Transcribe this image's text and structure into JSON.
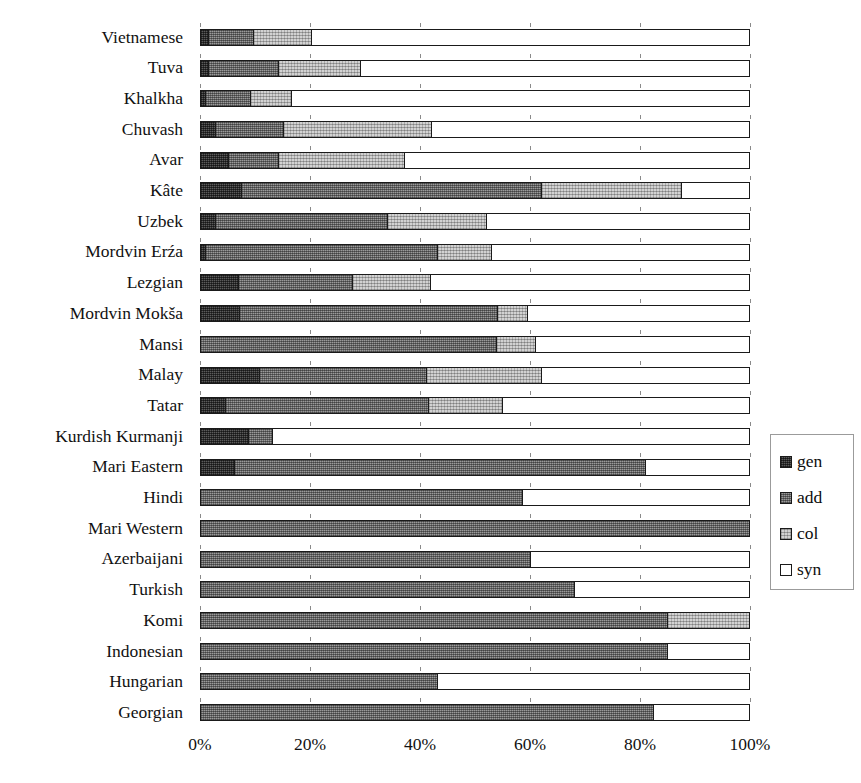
{
  "chart_data": {
    "type": "bar",
    "orientation": "horizontal",
    "stacked": true,
    "normalized": true,
    "title": "",
    "xlabel": "",
    "ylabel": "",
    "xlim": [
      0,
      100
    ],
    "xunit": "%",
    "grid": false,
    "legend_position": "right",
    "categories": [
      "Vietnamese",
      "Tuva",
      "Khalkha",
      "Chuvash",
      "Avar",
      "Kâte",
      "Uzbek",
      "Mordvin Erźa",
      "Lezgian",
      "Mordvin Mokša",
      "Mansi",
      "Malay",
      "Tatar",
      "Kurdish Kurmanji",
      "Mari Eastern",
      "Hindi",
      "Mari Western",
      "Azerbaijani",
      "Turkish",
      "Komi",
      "Indonesian",
      "Hungarian",
      "Georgian"
    ],
    "tick_labels": [
      "0%",
      "20%",
      "40%",
      "60%",
      "80%",
      "100%"
    ],
    "tick_values": [
      0,
      20,
      40,
      60,
      80,
      100
    ],
    "series": [
      {
        "name": "gen",
        "color": "#5b5b5b",
        "values": [
          1.2,
          1.2,
          0.8,
          2.6,
          5.0,
          7.3,
          2.6,
          0.8,
          6.7,
          6.9,
          0.0,
          10.5,
          4.4,
          8.5,
          6.0,
          0.0,
          0.0,
          0.0,
          0.0,
          0.0,
          0.0,
          0.0,
          0.0
        ]
      },
      {
        "name": "add",
        "color": "#9a9a9a",
        "values": [
          8.3,
          12.8,
          8.2,
          12.4,
          9.0,
          54.7,
          31.4,
          42.2,
          20.9,
          47.1,
          53.8,
          30.5,
          37.0,
          4.5,
          75.0,
          58.5,
          100.0,
          60.0,
          68.0,
          85.0,
          85.0,
          43.0,
          82.5
        ]
      },
      {
        "name": "col",
        "color": "#d2d2d2",
        "values": [
          10.5,
          15.0,
          7.5,
          27.0,
          23.0,
          25.6,
          18.0,
          10.0,
          14.2,
          5.5,
          7.2,
          21.0,
          13.6,
          0.0,
          0.0,
          0.0,
          0.0,
          0.0,
          0.0,
          15.0,
          0.0,
          0.0,
          0.0
        ]
      },
      {
        "name": "syn",
        "color": "#ffffff",
        "values": [
          80.0,
          71.0,
          83.5,
          58.0,
          63.0,
          12.4,
          48.0,
          47.0,
          58.2,
          40.5,
          39.0,
          38.0,
          45.0,
          87.0,
          19.0,
          41.5,
          0.0,
          40.0,
          32.0,
          0.0,
          15.0,
          57.0,
          17.5
        ]
      }
    ]
  },
  "legend": {
    "items": [
      {
        "label": "gen",
        "swatch": "fill-gen"
      },
      {
        "label": "add",
        "swatch": "fill-add"
      },
      {
        "label": "col",
        "swatch": "fill-col"
      },
      {
        "label": "syn",
        "swatch": "fill-syn"
      }
    ]
  }
}
